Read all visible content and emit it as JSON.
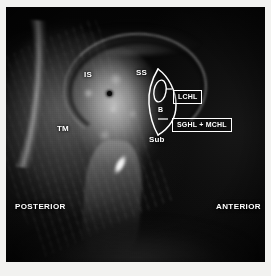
{
  "figure": {
    "modality": "MRI",
    "view": "axial",
    "body_part": "shoulder",
    "background_color": "#000000",
    "frame_color": "#f2f2f0",
    "annotation_color": "#ffffff"
  },
  "annotations": {
    "structures": [
      {
        "id": "IS",
        "label": "IS",
        "boxed": false
      },
      {
        "id": "SS",
        "label": "SS",
        "boxed": false
      },
      {
        "id": "TM",
        "label": "TM",
        "boxed": false
      },
      {
        "id": "B",
        "label": "B",
        "boxed": false
      },
      {
        "id": "Sub",
        "label": "Sub",
        "boxed": false
      },
      {
        "id": "LCHL",
        "label": "LCHL",
        "boxed": true
      },
      {
        "id": "SGHL_MCHL",
        "label": "SGHL + MCHL",
        "boxed": true
      }
    ],
    "orientation": [
      {
        "id": "posterior",
        "label": "POSTERIOR"
      },
      {
        "id": "anterior",
        "label": "ANTERIOR"
      }
    ]
  }
}
